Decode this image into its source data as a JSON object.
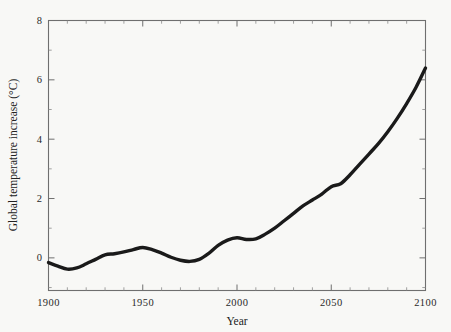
{
  "chart_data": {
    "type": "line",
    "title": "",
    "xlabel": "Year",
    "ylabel": "Global temperature increase (°C)",
    "xlim": [
      1900,
      2100
    ],
    "ylim": [
      -1.1,
      8
    ],
    "grid": false,
    "legend": null,
    "x_ticks_major": [
      1900,
      1950,
      2000,
      2050,
      2100
    ],
    "x_ticklabels": [
      "1900",
      "1950",
      "2000",
      "2050",
      "2100"
    ],
    "x_tick_minor_step": 10,
    "y_ticks_major": [
      0,
      2,
      4,
      6,
      8
    ],
    "y_ticklabels": [
      "0",
      "2",
      "4",
      "6",
      "8"
    ],
    "y_tick_minor_step": 1,
    "series": [
      {
        "name": "Global temperature increase",
        "color": "#1a1a1a",
        "x": [
          1900,
          1905,
          1910,
          1915,
          1920,
          1925,
          1930,
          1935,
          1940,
          1945,
          1950,
          1955,
          1960,
          1965,
          1970,
          1975,
          1980,
          1985,
          1990,
          1995,
          2000,
          2005,
          2010,
          2015,
          2020,
          2025,
          2030,
          2035,
          2040,
          2045,
          2050,
          2055,
          2060,
          2065,
          2070,
          2075,
          2080,
          2085,
          2090,
          2095,
          2100
        ],
        "y": [
          -0.16,
          -0.28,
          -0.38,
          -0.34,
          -0.2,
          -0.05,
          0.1,
          0.14,
          0.2,
          0.28,
          0.35,
          0.28,
          0.16,
          0.02,
          -0.08,
          -0.12,
          -0.05,
          0.15,
          0.42,
          0.6,
          0.68,
          0.62,
          0.64,
          0.8,
          1.0,
          1.25,
          1.5,
          1.75,
          1.95,
          2.15,
          2.4,
          2.5,
          2.8,
          3.15,
          3.5,
          3.85,
          4.25,
          4.7,
          5.2,
          5.75,
          6.4
        ]
      }
    ]
  },
  "axes": {
    "x_title": "Year",
    "y_title": "Global temperature increase (°C)"
  }
}
